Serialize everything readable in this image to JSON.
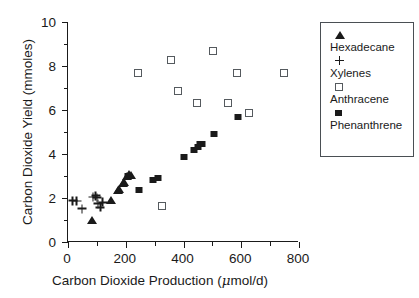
{
  "chart_data": {
    "type": "scatter",
    "title": "",
    "xlabel": "Carbon Dioxide Production (μmol/d)",
    "xlabel_pre": "Carbon Dioxide Production (",
    "xlabel_mu": "μ",
    "xlabel_post": "mol/d)",
    "ylabel": "Carbon Dioxide Yield (mmoles)",
    "xlim": [
      0,
      800
    ],
    "ylim": [
      0,
      10
    ],
    "xticks": [
      0,
      200,
      400,
      600,
      800
    ],
    "yticks": [
      0,
      2,
      4,
      6,
      8,
      10
    ],
    "xminorticks": [
      100,
      300,
      500,
      700
    ],
    "yminorticks": [
      1,
      3,
      5,
      7,
      9
    ],
    "grid": false,
    "legend_position": "right-outside",
    "series": [
      {
        "name": "Hexadecane",
        "marker": "filled-triangle",
        "color": "#1a1a1a",
        "points": [
          [
            83,
            1.02
          ],
          [
            148,
            1.9
          ],
          [
            172,
            2.36
          ],
          [
            176,
            2.42
          ],
          [
            190,
            2.66
          ],
          [
            194,
            2.74
          ],
          [
            206,
            3.02
          ],
          [
            212,
            3.08
          ],
          [
            218,
            3.05
          ]
        ]
      },
      {
        "name": "Xylenes",
        "marker": "plus",
        "color": "#1a1a1a",
        "points": [
          [
            16,
            1.88
          ],
          [
            30,
            1.86
          ],
          [
            48,
            1.51
          ],
          [
            86,
            2.04
          ],
          [
            96,
            2.1
          ],
          [
            101,
            2.02
          ],
          [
            104,
            1.74
          ],
          [
            112,
            1.58
          ],
          [
            120,
            1.8
          ]
        ]
      },
      {
        "name": "Anthracene",
        "marker": "open-square",
        "color": "#555a5e",
        "points": [
          [
            242,
            7.66
          ],
          [
            326,
            1.62
          ],
          [
            357,
            8.27
          ],
          [
            381,
            6.88
          ],
          [
            447,
            6.33
          ],
          [
            502,
            8.7
          ],
          [
            554,
            6.33
          ],
          [
            585,
            7.68
          ],
          [
            627,
            5.88
          ],
          [
            748,
            7.7
          ]
        ]
      },
      {
        "name": "Phenanthrene",
        "marker": "filled-square",
        "color": "#1a1a1a",
        "points": [
          [
            207,
            2.98
          ],
          [
            246,
            2.38
          ],
          [
            294,
            2.8
          ],
          [
            312,
            2.92
          ],
          [
            403,
            3.88
          ],
          [
            437,
            4.18
          ],
          [
            451,
            4.34
          ],
          [
            458,
            4.44
          ],
          [
            465,
            4.46
          ],
          [
            505,
            4.9
          ],
          [
            588,
            5.7
          ]
        ]
      }
    ]
  },
  "legend": {
    "entries": [
      {
        "label": "Hexadecane",
        "marker": "filled-triangle"
      },
      {
        "label": "Xylenes",
        "marker": "plus"
      },
      {
        "label": "Anthracene",
        "marker": "open-square"
      },
      {
        "label": "Phenanthrene",
        "marker": "filled-square"
      }
    ]
  }
}
